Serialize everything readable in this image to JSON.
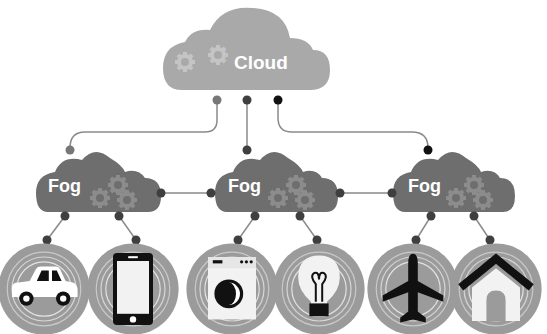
{
  "cloud": {
    "label": "Cloud",
    "color": "#a9a9a9"
  },
  "fog_nodes": [
    {
      "label": "Fog",
      "color": "#6e6e6e"
    },
    {
      "label": "Fog",
      "color": "#6e6e6e"
    },
    {
      "label": "Fog",
      "color": "#6e6e6e"
    }
  ],
  "devices": [
    {
      "name": "car",
      "icon": "car-icon"
    },
    {
      "name": "smartphone",
      "icon": "smartphone-icon"
    },
    {
      "name": "washing-machine",
      "icon": "washing-machine-icon"
    },
    {
      "name": "light-bulb",
      "icon": "light-bulb-icon"
    },
    {
      "name": "airplane",
      "icon": "airplane-icon"
    },
    {
      "name": "house",
      "icon": "house-icon"
    }
  ],
  "colors": {
    "connector_line": "#8a8a8a",
    "dot_light": "#777777",
    "dot_mid": "#3f3f3f",
    "dot_dark": "#111111",
    "device_disc": "#9b9b9b",
    "ring": "#d8d8d8"
  }
}
